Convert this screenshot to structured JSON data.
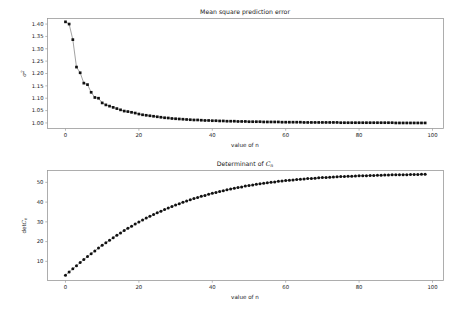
{
  "figure": {
    "background": "#ffffff",
    "page_background": "#f2f2f2",
    "width": 465,
    "height": 310
  },
  "chart_data": [
    {
      "type": "scatter",
      "name": "mean-square-prediction-error",
      "title": "Mean square prediction error",
      "xlabel": "value of n",
      "ylabel": "σ²",
      "ylabel_parts": {
        "symbol": "σ",
        "superscript": "2"
      },
      "xlim": [
        -4.9,
        103.0
      ],
      "ylim": [
        0.9775,
        1.4225
      ],
      "xticks": [
        0,
        20,
        40,
        60,
        80,
        100
      ],
      "xticklabels": [
        "0",
        "20",
        "40",
        "60",
        "80",
        "100"
      ],
      "yticks": [
        1.0,
        1.05,
        1.1,
        1.15,
        1.2,
        1.25,
        1.3,
        1.35,
        1.4
      ],
      "yticklabels": [
        "1.00",
        "1.05",
        "1.10",
        "1.15",
        "1.20",
        "1.25",
        "1.30",
        "1.35",
        "1.40"
      ],
      "grid": false,
      "legend": "none",
      "marker": "square",
      "marker_color": "#111111",
      "line_color": "#555555",
      "x": [
        0,
        1,
        2,
        3,
        4,
        5,
        6,
        7,
        8,
        9,
        10,
        11,
        12,
        13,
        14,
        15,
        16,
        17,
        18,
        19,
        20,
        21,
        22,
        23,
        24,
        25,
        26,
        27,
        28,
        29,
        30,
        31,
        32,
        33,
        34,
        35,
        36,
        37,
        38,
        39,
        40,
        41,
        42,
        43,
        44,
        45,
        46,
        47,
        48,
        49,
        50,
        51,
        52,
        53,
        54,
        55,
        56,
        57,
        58,
        59,
        60,
        61,
        62,
        63,
        64,
        65,
        66,
        67,
        68,
        69,
        70,
        71,
        72,
        73,
        74,
        75,
        76,
        77,
        78,
        79,
        80,
        81,
        82,
        83,
        84,
        85,
        86,
        87,
        88,
        89,
        90,
        91,
        92,
        93,
        94,
        95,
        96,
        97,
        98
      ],
      "y": [
        1.409,
        1.4,
        1.337,
        1.226,
        1.203,
        1.161,
        1.155,
        1.124,
        1.103,
        1.1,
        1.081,
        1.073,
        1.068,
        1.063,
        1.058,
        1.053,
        1.048,
        1.046,
        1.043,
        1.04,
        1.036,
        1.033,
        1.031,
        1.029,
        1.027,
        1.025,
        1.023,
        1.021,
        1.02,
        1.018,
        1.017,
        1.016,
        1.015,
        1.014,
        1.013,
        1.012,
        1.012,
        1.011,
        1.01,
        1.01,
        1.009,
        1.009,
        1.008,
        1.008,
        1.007,
        1.007,
        1.007,
        1.006,
        1.006,
        1.006,
        1.005,
        1.005,
        1.005,
        1.005,
        1.004,
        1.004,
        1.004,
        1.004,
        1.004,
        1.003,
        1.003,
        1.003,
        1.003,
        1.003,
        1.003,
        1.002,
        1.002,
        1.002,
        1.002,
        1.002,
        1.002,
        1.002,
        1.002,
        1.002,
        1.002,
        1.001,
        1.001,
        1.001,
        1.001,
        1.001,
        1.001,
        1.001,
        1.001,
        1.001,
        1.001,
        1.001,
        1.001,
        1.001,
        1.001,
        1.001,
        1.0,
        1.0,
        1.0,
        1.0,
        1.0,
        1.0,
        1.0,
        1.0,
        1.0
      ]
    },
    {
      "type": "scatter",
      "name": "determinant-of-cn",
      "title": "Determinant of Cₙ",
      "title_parts": {
        "prefix": "Determinant of ",
        "symbol": "C",
        "subscript": "n"
      },
      "xlabel": "value of n",
      "ylabel": "detCₙ",
      "ylabel_parts": {
        "prefix": "det",
        "symbol": "C",
        "subscript": "n"
      },
      "xlim": [
        -4.9,
        103.0
      ],
      "ylim": [
        0.3,
        56.0
      ],
      "xticks": [
        0,
        20,
        40,
        60,
        80,
        100
      ],
      "xticklabels": [
        "0",
        "20",
        "40",
        "60",
        "80",
        "100"
      ],
      "yticks": [
        10,
        20,
        30,
        40,
        50
      ],
      "yticklabels": [
        "10",
        "20",
        "30",
        "40",
        "50"
      ],
      "grid": false,
      "legend": "none",
      "marker": "circle",
      "marker_color": "#111111",
      "line_color": "#555555",
      "x": [
        0,
        1,
        2,
        3,
        4,
        5,
        6,
        7,
        8,
        9,
        10,
        11,
        12,
        13,
        14,
        15,
        16,
        17,
        18,
        19,
        20,
        21,
        22,
        23,
        24,
        25,
        26,
        27,
        28,
        29,
        30,
        31,
        32,
        33,
        34,
        35,
        36,
        37,
        38,
        39,
        40,
        41,
        42,
        43,
        44,
        45,
        46,
        47,
        48,
        49,
        50,
        51,
        52,
        53,
        54,
        55,
        56,
        57,
        58,
        59,
        60,
        61,
        62,
        63,
        64,
        65,
        66,
        67,
        68,
        69,
        70,
        71,
        72,
        73,
        74,
        75,
        76,
        77,
        78,
        79,
        80,
        81,
        82,
        83,
        84,
        85,
        86,
        87,
        88,
        89,
        90,
        91,
        92,
        93,
        94,
        95,
        96,
        97,
        98
      ],
      "y": [
        3.0,
        4.6,
        6.2,
        7.8,
        9.4,
        10.9,
        12.4,
        13.9,
        15.3,
        16.7,
        18.1,
        19.4,
        20.7,
        22.0,
        23.2,
        24.4,
        25.6,
        26.7,
        27.8,
        28.9,
        29.9,
        30.9,
        31.9,
        32.8,
        33.7,
        34.6,
        35.4,
        36.2,
        37.0,
        37.8,
        38.5,
        39.2,
        39.9,
        40.5,
        41.2,
        41.8,
        42.3,
        42.9,
        43.4,
        44.0,
        44.5,
        44.9,
        45.4,
        45.8,
        46.2,
        46.6,
        47.0,
        47.4,
        47.7,
        48.1,
        48.4,
        48.7,
        49.0,
        49.3,
        49.5,
        49.8,
        50.0,
        50.2,
        50.5,
        50.7,
        50.9,
        51.1,
        51.2,
        51.4,
        51.6,
        51.7,
        51.9,
        52.0,
        52.1,
        52.3,
        52.4,
        52.5,
        52.6,
        52.7,
        52.8,
        52.9,
        53.0,
        53.1,
        53.1,
        53.2,
        53.3,
        53.4,
        53.4,
        53.5,
        53.5,
        53.6,
        53.6,
        53.7,
        53.7,
        53.8,
        53.8,
        53.9,
        53.9,
        53.9,
        54.0,
        54.0,
        54.0,
        54.1,
        54.1
      ]
    }
  ]
}
